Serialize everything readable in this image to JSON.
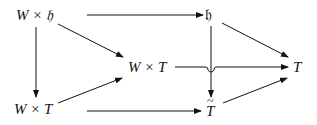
{
  "diagram": {
    "type": "commutative-diagram",
    "nodes": {
      "wxh": {
        "label": "W × 𝔥"
      },
      "h": {
        "label": "𝔥"
      },
      "wxt_mid": {
        "label": "W × T"
      },
      "t_right": {
        "label": "T"
      },
      "wxt_bottom": {
        "label": "W × T"
      },
      "t_tilde": {
        "label": "T"
      }
    },
    "edges": [
      {
        "from": "wxh",
        "to": "h"
      },
      {
        "from": "wxh",
        "to": "wxt_mid"
      },
      {
        "from": "wxh",
        "to": "wxt_bottom"
      },
      {
        "from": "h",
        "to": "t_right"
      },
      {
        "from": "h",
        "to": "t_tilde"
      },
      {
        "from": "wxt_mid",
        "to": "t_right"
      },
      {
        "from": "wxt_bottom",
        "to": "wxt_mid"
      },
      {
        "from": "wxt_bottom",
        "to": "t_tilde"
      },
      {
        "from": "t_tilde",
        "to": "t_right"
      }
    ]
  }
}
